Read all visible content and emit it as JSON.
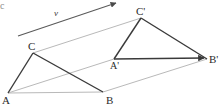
{
  "figure": {
    "width": 219,
    "height": 108,
    "background_color": "#ffffff",
    "solid_stroke_color": "#3a3a3a",
    "light_stroke_color": "#b9b9b9",
    "label_color": "#2b2b2b"
  },
  "vector": {
    "name": "translation-vector",
    "label": "v",
    "label_x": 54,
    "label_y": 9,
    "start_x": 18,
    "start_y": 36,
    "end_x": 119,
    "end_y": 2,
    "has_arrowhead": true
  },
  "edge_fragment": {
    "label": "c",
    "x": 0,
    "y": 1
  },
  "points": [
    {
      "name": "point-a",
      "label": "A",
      "x": 8,
      "y": 93,
      "label_x": 2,
      "label_y": 95
    },
    {
      "name": "point-b",
      "label": "B",
      "x": 103,
      "y": 92,
      "label_x": 106,
      "label_y": 95
    },
    {
      "name": "point-c",
      "label": "C",
      "x": 33,
      "y": 53,
      "label_x": 28,
      "label_y": 41
    },
    {
      "name": "point-a-prime",
      "label": "A'",
      "x": 114,
      "y": 59,
      "label_x": 110,
      "label_y": 61
    },
    {
      "name": "point-b-prime",
      "label": "B'",
      "x": 207,
      "y": 59,
      "label_x": 209,
      "label_y": 54
    },
    {
      "name": "point-c-prime",
      "label": "C'",
      "x": 141,
      "y": 18,
      "label_x": 136,
      "label_y": 6
    }
  ],
  "triangle_original": {
    "name": "triangle-abc",
    "vertices": [
      "A",
      "B",
      "C"
    ],
    "solid_edges": [
      {
        "name": "edge-a-c",
        "from": "A",
        "to": "C"
      },
      {
        "name": "edge-c-b",
        "from": "C",
        "to": "B"
      }
    ],
    "light_edges": [
      {
        "name": "edge-a-b",
        "from": "A",
        "to": "B"
      }
    ]
  },
  "triangle_image": {
    "name": "triangle-a-prime-b-prime-c-prime",
    "vertices": [
      "A'",
      "B'",
      "C'"
    ],
    "solid_edges": [
      {
        "name": "edge-a-prime-c-prime",
        "from": "A'",
        "to": "C'"
      },
      {
        "name": "edge-c-prime-b-prime",
        "from": "C'",
        "to": "B'"
      },
      {
        "name": "edge-a-prime-b-prime",
        "from": "A'",
        "to": "B'",
        "has_arrowhead": true
      }
    ]
  },
  "translation_guides": [
    {
      "name": "guide-a-to-a-prime",
      "from": "A",
      "to": "A'"
    },
    {
      "name": "guide-b-to-b-prime",
      "from": "B",
      "to": "B'"
    },
    {
      "name": "guide-c-to-c-prime",
      "from": "C",
      "to": "C'"
    }
  ]
}
